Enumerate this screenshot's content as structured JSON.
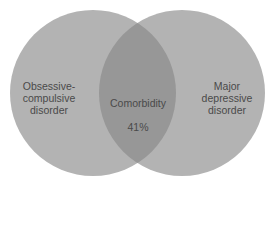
{
  "diagram": {
    "type": "venn",
    "sets": [
      {
        "id": "left",
        "label": "Obsessive-\ncompulsive\ndisorder",
        "color": "#b2b2b2"
      },
      {
        "id": "right",
        "label": "Major\ndepressive\ndisorder",
        "color": "#b2b2b2"
      }
    ],
    "intersection": {
      "label": "Comorbidity",
      "value": "41%",
      "color": "#969696"
    },
    "text_color": "#4a4a4a",
    "background": "#ffffff"
  }
}
